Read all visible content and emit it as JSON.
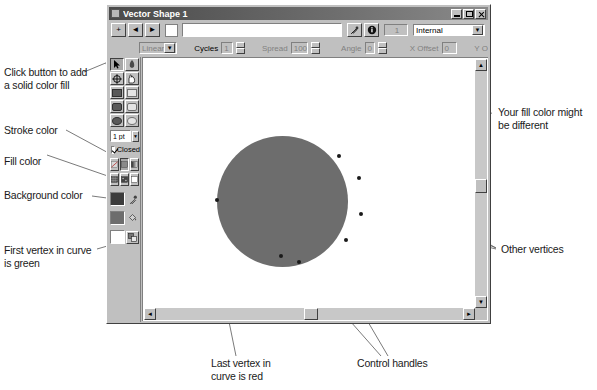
{
  "window": {
    "title": "Vector Shape 1",
    "titlebar_icon": "vector-shape-icon",
    "buttons": {
      "minimize": "minimize-button",
      "maximize": "maximize-button",
      "close": "close-button"
    }
  },
  "toolbar_top": {
    "add_label": "+",
    "prev_label": "◄",
    "next_label": "►",
    "color_chip": "",
    "gradient_field_value": "",
    "icon_button_1": "pick-color-icon",
    "icon_button_2": "info-icon",
    "count_value": "1",
    "scope_value": "Internal",
    "scope_options": [
      "Internal"
    ]
  },
  "toolbar_second": {
    "tool_arrow": "selection-arrow-icon",
    "tool_pen": "pen-icon",
    "gradient_type_value": "Linear",
    "gradient_type_options": [
      "Linear"
    ],
    "cycles_label": "Cycles",
    "cycles_value": "1",
    "spread_label": "Spread",
    "spread_value": "100",
    "angle_label": "Angle",
    "angle_value": "0",
    "xoffset_label": "X Offset",
    "xoffset_value": "0",
    "yoffset_label": "Y O"
  },
  "palette": {
    "tools": [
      {
        "name": "pointer-tool",
        "pressed": true
      },
      {
        "name": "pen-tool",
        "pressed": false
      },
      {
        "name": "crosshair-tool",
        "pressed": false
      },
      {
        "name": "hand-tool",
        "pressed": false
      },
      {
        "name": "filled-rect-tool",
        "pressed": false
      },
      {
        "name": "outline-rect-tool",
        "pressed": false
      },
      {
        "name": "filled-roundrect-tool",
        "pressed": false
      },
      {
        "name": "outline-roundrect-tool",
        "pressed": false
      },
      {
        "name": "filled-ellipse-tool",
        "pressed": false
      },
      {
        "name": "outline-ellipse-tool",
        "pressed": false
      }
    ],
    "pen_width_value": "1 pt",
    "closed_label": "Closed",
    "closed_checked": true,
    "fill_buttons": [
      {
        "name": "no-fill-button"
      },
      {
        "name": "solid-color-fill-button"
      },
      {
        "name": "gradient-fill-button"
      },
      {
        "name": "pattern-fill-button"
      },
      {
        "name": "texture-fill-button"
      },
      {
        "name": "white-fill-button"
      }
    ],
    "stroke_color": "#3c3c3c",
    "fill_color": "#6d6d6d",
    "background_color": "#ffffff",
    "side_icons": [
      {
        "name": "dropper-icon"
      },
      {
        "name": "paint-bucket-icon"
      },
      {
        "name": "swap-colors-icon"
      }
    ]
  },
  "canvas": {
    "shape_name": "filled-circle-shape",
    "shape_fill": "#6d6d6d",
    "vertices": [
      {
        "name": "vertex-top-right",
        "x": 196,
        "y": 98
      },
      {
        "name": "vertex-right-upper",
        "x": 216,
        "y": 120
      },
      {
        "name": "vertex-right-mid",
        "x": 218,
        "y": 156
      },
      {
        "name": "vertex-right-lower",
        "x": 203,
        "y": 182
      },
      {
        "name": "vertex-bottom",
        "x": 156,
        "y": 204
      },
      {
        "name": "vertex-bottom-left",
        "x": 140,
        "y": 199
      },
      {
        "name": "vertex-left",
        "x": 74,
        "y": 142
      }
    ],
    "vscroll": {
      "name": "vertical-scrollbar",
      "up": "▲",
      "down": "▼"
    },
    "hscroll": {
      "name": "horizontal-scrollbar",
      "left": "◄",
      "right": "►"
    }
  },
  "annotations": {
    "top_cut_text": "",
    "fill_button": "Click button to add\na solid color fill",
    "stroke_color": "Stroke color",
    "fill_color": "Fill color",
    "background_color": "Background color",
    "first_vertex": "First vertex in curve\nis green",
    "your_fill": "Your fill color might\nbe different",
    "other_vertices": "Other vertices",
    "last_vertex": "Last vertex in\ncurve is red",
    "control_handles": "Control handles"
  }
}
